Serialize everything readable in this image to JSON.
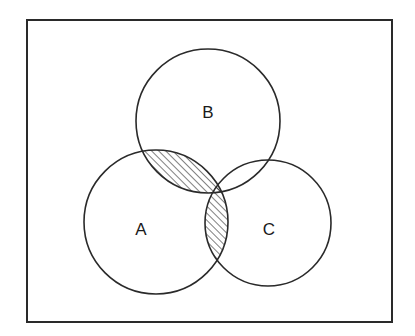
{
  "diagram": {
    "type": "venn",
    "universe": {
      "x": 27,
      "y": 20,
      "width": 365,
      "height": 302,
      "stroke": "#2a2a2a"
    },
    "sets": [
      {
        "id": "A",
        "label": "A",
        "cx": 156,
        "cy": 222,
        "r": 72
      },
      {
        "id": "B",
        "label": "B",
        "cx": 208,
        "cy": 121,
        "r": 72
      },
      {
        "id": "C",
        "label": "C",
        "cx": 268,
        "cy": 223,
        "r": 63
      }
    ],
    "shaded_region": "A ∩ (B ∪ C)",
    "shaded_parts": [
      "A ∩ B",
      "A ∩ C"
    ],
    "hatch_style": "diagonal lines",
    "line_color": "#2a2a2a"
  }
}
